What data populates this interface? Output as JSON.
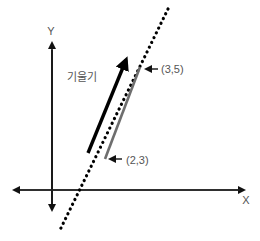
{
  "diagram": {
    "axes": {
      "x_label": "X",
      "y_label": "Y"
    },
    "slope_label": "기울기",
    "points": [
      {
        "label": "(2,3)",
        "x": 2,
        "y": 3
      },
      {
        "label": "(3,5)",
        "x": 3,
        "y": 5
      }
    ],
    "colors": {
      "axis": "#111111",
      "dotted_line": "#000000",
      "segment": "#6e6e6e",
      "slope_arrow": "#000000",
      "text": "#555555"
    }
  }
}
